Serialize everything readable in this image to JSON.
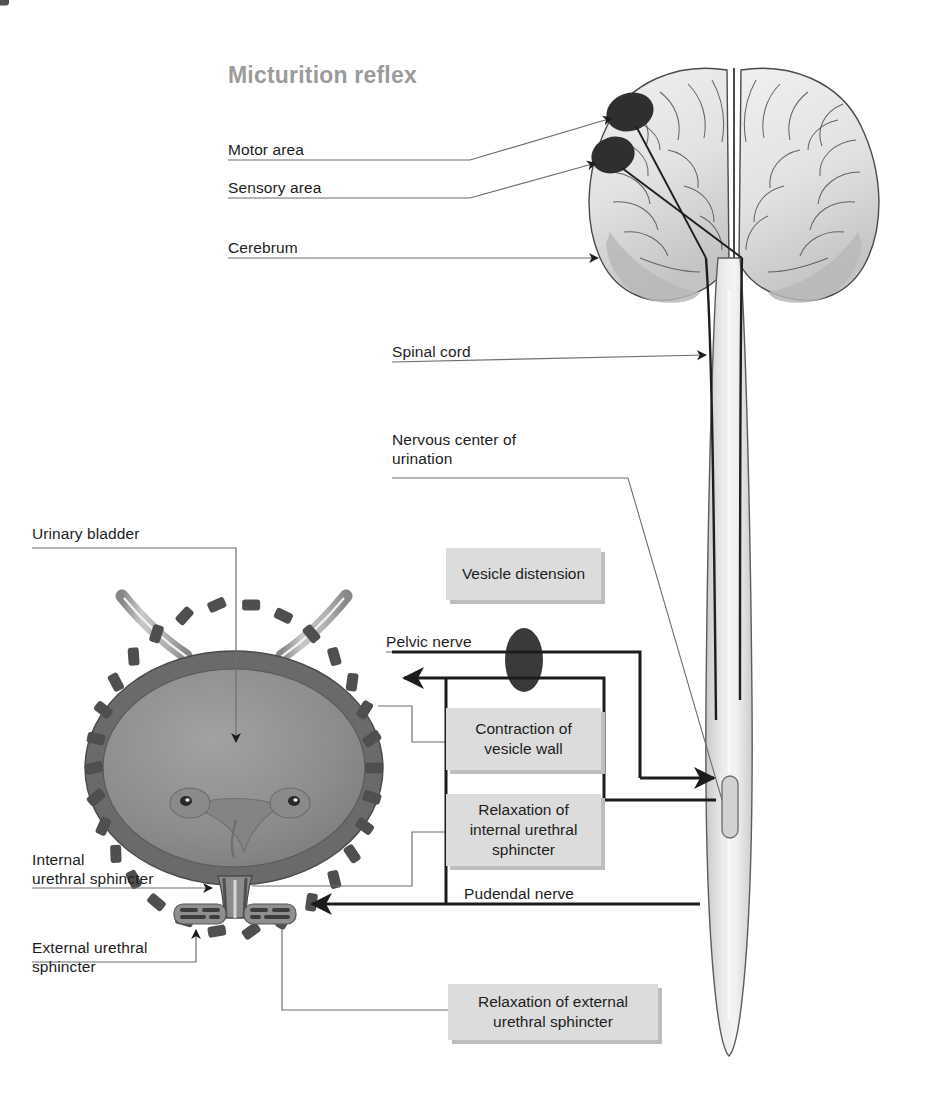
{
  "title": "Micturition reflex",
  "labels": {
    "motor_area": "Motor area",
    "sensory_area": "Sensory area",
    "cerebrum": "Cerebrum",
    "spinal_cord": "Spinal cord",
    "nervous_center": "Nervous center of\nurination",
    "urinary_bladder": "Urinary bladder",
    "pelvic_nerve": "Pelvic nerve",
    "pudendal_nerve": "Pudendal nerve",
    "internal_sphincter": "Internal\nurethral sphincter",
    "external_sphincter": "External urethral\nsphincter"
  },
  "boxes": {
    "vesicle_distension": "Vesicle distension",
    "contraction_vesicle_wall": "Contraction of\nvesicle wall",
    "relaxation_internal_sphincter": "Relaxation of\ninternal urethral\nsphincter",
    "relaxation_external_sphincter": "Relaxation of external\nurethral sphincter"
  },
  "colors": {
    "title_gray": "#9b9b9b",
    "box_fill": "#dcdcdc",
    "box_shadow": "#bdbdbd",
    "text": "#1d1d1d",
    "leader_line": "#6e6e6e",
    "pathway_line": "#1c1c1c",
    "brain_fill": "#e4e4e4",
    "brain_shade": "#b9b9b9",
    "cortex_spot": "#2f2f2f",
    "bladder_lumen": "#8e8e8e",
    "bladder_wall": "#6a6a6a",
    "bladder_muscle": "#585858",
    "cord_fill": "#dddddd",
    "ganglion": "#3a3a3a"
  },
  "diagram": {
    "type": "anatomical-diagram",
    "structures": [
      "cerebrum",
      "motor area",
      "sensory area",
      "spinal cord",
      "nervous center of urination",
      "urinary bladder",
      "ureters",
      "trigone",
      "internal urethral sphincter",
      "external urethral sphincter",
      "pelvic nerve",
      "pudendal nerve"
    ]
  }
}
